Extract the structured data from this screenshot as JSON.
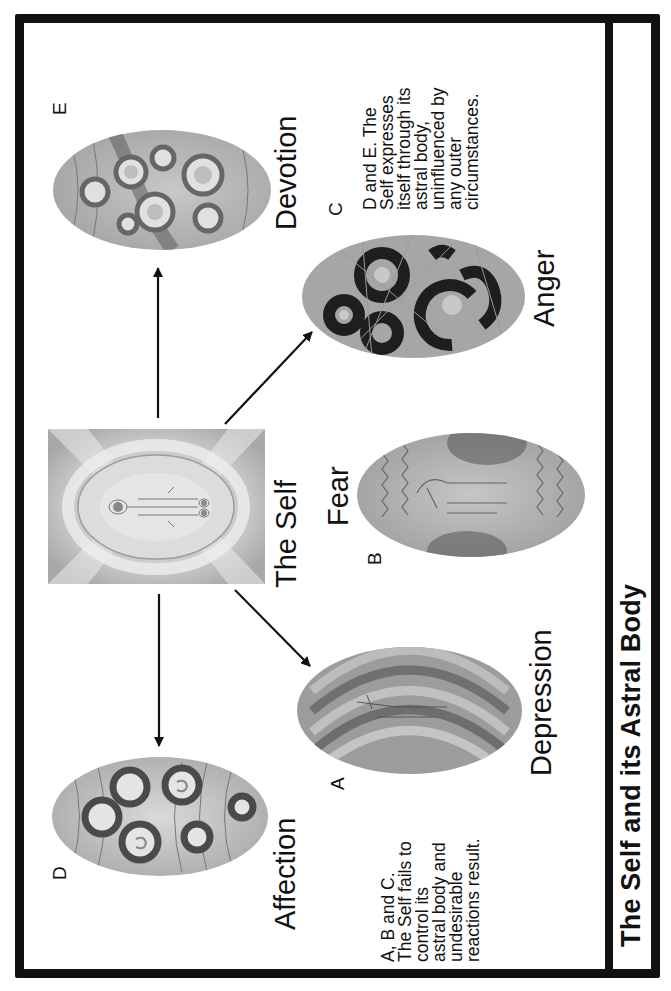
{
  "title": "The Self and its Astral Body",
  "center": {
    "label": "The Self"
  },
  "states": [
    {
      "letter": "A",
      "label": "Depression",
      "kind": "uncontrolled"
    },
    {
      "letter": "B",
      "label": "Fear",
      "kind": "uncontrolled"
    },
    {
      "letter": "C",
      "label": "Anger",
      "kind": "uncontrolled"
    },
    {
      "letter": "D",
      "label": "Affection",
      "kind": "self-expressed"
    },
    {
      "letter": "E",
      "label": "Devotion",
      "kind": "self-expressed"
    }
  ],
  "notes": {
    "abc": "A, B and C.\nThe Self fails to\ncontrol its\nastral body and\nundesirable\nreactions result.",
    "de": "D and E. The\nSelf expresses\nitself through its\nastral body,\nuninfluenced by\nany outer\ncircumstances."
  },
  "colors": {
    "ink": "#111111",
    "background": "#ffffff",
    "egg_light": "#d8d8d8",
    "egg_mid": "#9a9a9a",
    "egg_dark": "#3a3a3a"
  },
  "orientation": "rotated 90deg counterclockwise"
}
